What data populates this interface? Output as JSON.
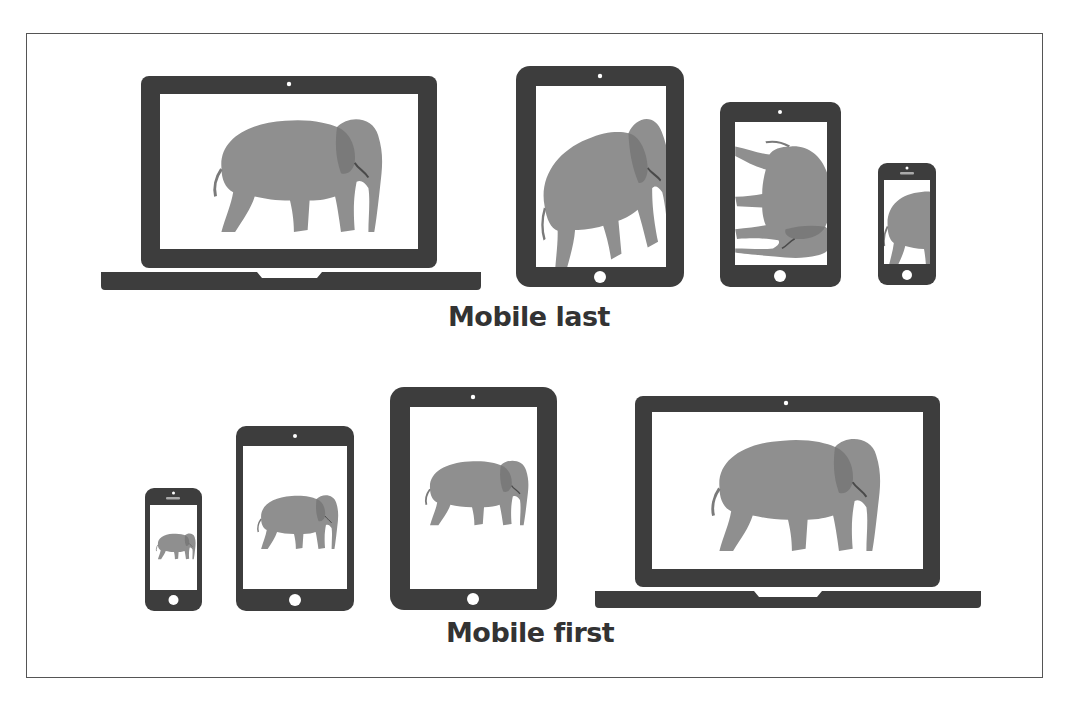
{
  "colors": {
    "device": "#3d3d3d",
    "screen": "#ffffff",
    "elephant": "#8f8f8f",
    "elephant_shadow": "#6e6e6e",
    "label": "#333333",
    "frame_border": "#555555"
  },
  "sections": [
    {
      "id": "mobile-last",
      "label": "Mobile last",
      "devices": [
        {
          "type": "laptop",
          "content": "elephant-full"
        },
        {
          "type": "tablet-large",
          "content": "elephant-cropped-zoomed"
        },
        {
          "type": "tablet-medium",
          "content": "elephant-rotated"
        },
        {
          "type": "phone",
          "content": "elephant-cropped-rear"
        }
      ]
    },
    {
      "id": "mobile-first",
      "label": "Mobile first",
      "devices": [
        {
          "type": "phone",
          "content": "elephant-full"
        },
        {
          "type": "tablet-medium",
          "content": "elephant-full"
        },
        {
          "type": "tablet-large",
          "content": "elephant-full"
        },
        {
          "type": "laptop",
          "content": "elephant-full"
        }
      ]
    }
  ]
}
